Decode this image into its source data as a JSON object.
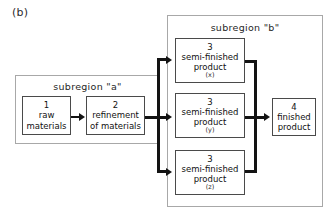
{
  "figure": {
    "panel_label": "(b)",
    "caption_type": "process-flow-diagram"
  },
  "regions": [
    {
      "key": "a",
      "title": "subregion \"a\""
    },
    {
      "key": "b",
      "title": "subregion \"b\""
    }
  ],
  "nodes": [
    {
      "key": "n1",
      "id": "1",
      "line1": "raw",
      "line2": "materials",
      "sub": ""
    },
    {
      "key": "n2",
      "id": "2",
      "line1": "refinement",
      "line2": "of materials",
      "sub": ""
    },
    {
      "key": "n3x",
      "id": "3",
      "line1": "semi-finished",
      "line2": "product",
      "sub": "(x)"
    },
    {
      "key": "n3y",
      "id": "3",
      "line1": "semi-finished",
      "line2": "product",
      "sub": "(y)"
    },
    {
      "key": "n3z",
      "id": "3",
      "line1": "semi-finished",
      "line2": "product",
      "sub": "(z)"
    },
    {
      "key": "n4",
      "id": "4",
      "line1": "finished",
      "line2": "product",
      "sub": ""
    }
  ],
  "colors": {
    "background": "#ffffff",
    "node_border": "#4a4a4a",
    "region_border": "#a8a8a8",
    "connector": "#131313",
    "text": "#111111"
  }
}
